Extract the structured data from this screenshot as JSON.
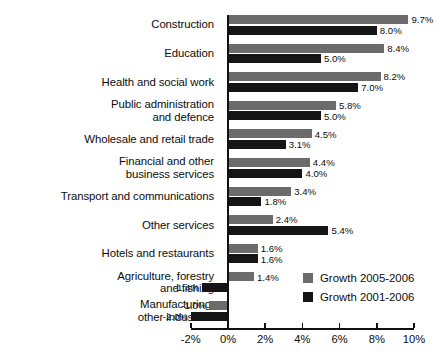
{
  "chart_data": {
    "type": "bar",
    "orientation": "horizontal",
    "title": "",
    "subtitle": "",
    "xlabel": "",
    "ylabel": "",
    "xlim": [
      -2,
      10
    ],
    "grid": false,
    "legend_position": "inside-bottom-right",
    "axis_tick_labels": [
      "-2%",
      "0%",
      "2%",
      "4%",
      "6%",
      "8%",
      "10%"
    ],
    "axis_tick_values": [
      -2,
      0,
      2,
      4,
      6,
      8,
      10
    ],
    "value_label_suffix": "%",
    "categories": [
      "Construction",
      "Education",
      "Health and social work",
      "Public administration\nand defence",
      "Wholesale and retail trade",
      "Financial and other\nbusiness services",
      "Transport and communications",
      "Other services",
      "Hotels and restaurants",
      "Agriculture, forestry\nand fishing",
      "Manufacturing,\nother industries"
    ],
    "series": [
      {
        "name": "Growth 2005-2006",
        "color": "#6b6b6b",
        "values": [
          9.7,
          8.4,
          8.2,
          5.8,
          4.5,
          4.4,
          3.4,
          2.4,
          1.6,
          1.4,
          -1.0
        ],
        "labels": [
          "9.7%",
          "8.4%",
          "8.2%",
          "5.8%",
          "4.5%",
          "4.4%",
          "3.4%",
          "2.4%",
          "1.6%",
          "1.4%",
          "-1.0%"
        ]
      },
      {
        "name": "Growth 2001-2006",
        "color": "#151515",
        "values": [
          8.0,
          5.0,
          7.0,
          5.0,
          3.1,
          4.0,
          1.8,
          5.4,
          1.6,
          -1.4,
          -2.0
        ],
        "labels": [
          "8.0%",
          "5.0%",
          "7.0%",
          "5.0%",
          "3.1%",
          "4.0%",
          "1.8%",
          "5.4%",
          "1.6%",
          "-1.4%",
          "-2.0%"
        ]
      }
    ]
  },
  "legend": {
    "items": [
      {
        "label": "Growth 2005-2006",
        "swatch": "recent"
      },
      {
        "label": "Growth 2001-2006",
        "swatch": "longrun"
      }
    ]
  }
}
